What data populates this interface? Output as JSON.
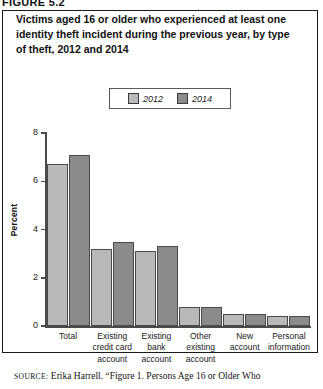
{
  "figure": {
    "header": "FIGURE 5.2",
    "title": "Victims aged 16 or older who experienced at least one identity theft incident during the previous year, by type of theft, 2012 and 2014"
  },
  "legend": {
    "position": "top-center",
    "items": [
      {
        "label": "2012",
        "color": "#b9b9b9"
      },
      {
        "label": "2014",
        "color": "#8b8b8b"
      }
    ]
  },
  "axis": {
    "ylabel": "Percent",
    "yticks": [
      "0",
      "2",
      "4",
      "6",
      "8"
    ]
  },
  "source": {
    "prefix": "SOURCE:",
    "text": "Erika Harrell. “Figure 1. Persons Age 16 or Older Who"
  },
  "chart_data": {
    "type": "bar",
    "title": "Victims aged 16 or older who experienced at least one identity theft incident during the previous year, by type of theft, 2012 and 2014",
    "xlabel": "",
    "ylabel": "Percent",
    "ylim": [
      0,
      8
    ],
    "yticks": [
      0,
      2,
      4,
      6,
      8
    ],
    "grid": false,
    "legend_position": "top-center",
    "categories": [
      "Total",
      "Existing credit card account",
      "Existing bank account",
      "Other existing account",
      "New account",
      "Personal information"
    ],
    "category_lines": [
      [
        "Total"
      ],
      [
        "Existing",
        "credit card",
        "account"
      ],
      [
        "Existing",
        "bank",
        "account"
      ],
      [
        "Other",
        "existing",
        "account"
      ],
      [
        "New",
        "account"
      ],
      [
        "Personal",
        "information"
      ]
    ],
    "series": [
      {
        "name": "2012",
        "color": "#b9b9b9",
        "values": [
          6.7,
          3.2,
          3.1,
          0.8,
          0.5,
          0.4
        ]
      },
      {
        "name": "2014",
        "color": "#8b8b8b",
        "values": [
          7.1,
          3.5,
          3.3,
          0.8,
          0.5,
          0.4
        ]
      }
    ]
  }
}
